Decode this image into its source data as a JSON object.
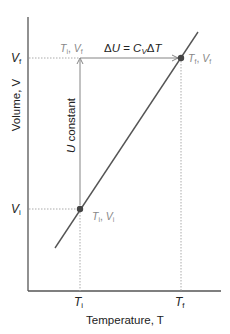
{
  "diagram": {
    "y_axis_label": "Volume, V",
    "x_axis_label": "Temperature, T",
    "y_ticks": [
      {
        "main": "V",
        "sub": "f"
      },
      {
        "main": "V",
        "sub": "i"
      }
    ],
    "x_ticks": [
      {
        "main": "T",
        "sub": "i"
      },
      {
        "main": "T",
        "sub": "f"
      }
    ],
    "points": {
      "initial": {
        "label_T": "T",
        "label_T_sub": "i",
        "sep": ", ",
        "label_V": "V",
        "label_V_sub": "i"
      },
      "intermediate": {
        "label_T": "T",
        "label_T_sub": "i",
        "sep": ", ",
        "label_V": "V",
        "label_V_sub": "f"
      },
      "final": {
        "label_T": "T",
        "label_T_sub": "f",
        "sep": ", ",
        "label_V": "V",
        "label_V_sub": "f"
      }
    },
    "vertical_arrow_label": {
      "var": "U",
      "text": " constant"
    },
    "horizontal_arrow_label": {
      "delta": "Δ",
      "var": "U",
      "eq": " = ",
      "c": "C",
      "c_sub": "V",
      "delta2": "Δ",
      "t": "T"
    },
    "colors": {
      "axis": "#555555",
      "line": "#555555",
      "point": "#444444",
      "label_gray": "#888888",
      "text": "#222222",
      "dotted": "#aaaaaa"
    }
  }
}
